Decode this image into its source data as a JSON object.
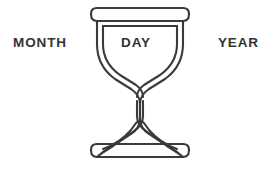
{
  "figure": {
    "name": "hourglass-diagram",
    "icon": "hourglass-icon",
    "stroke_color": "#3a3a3a",
    "background_color": "#ffffff",
    "text_color": "#333333"
  },
  "labels": {
    "left": "MONTH",
    "center": "DAY",
    "right": "YEAR"
  }
}
